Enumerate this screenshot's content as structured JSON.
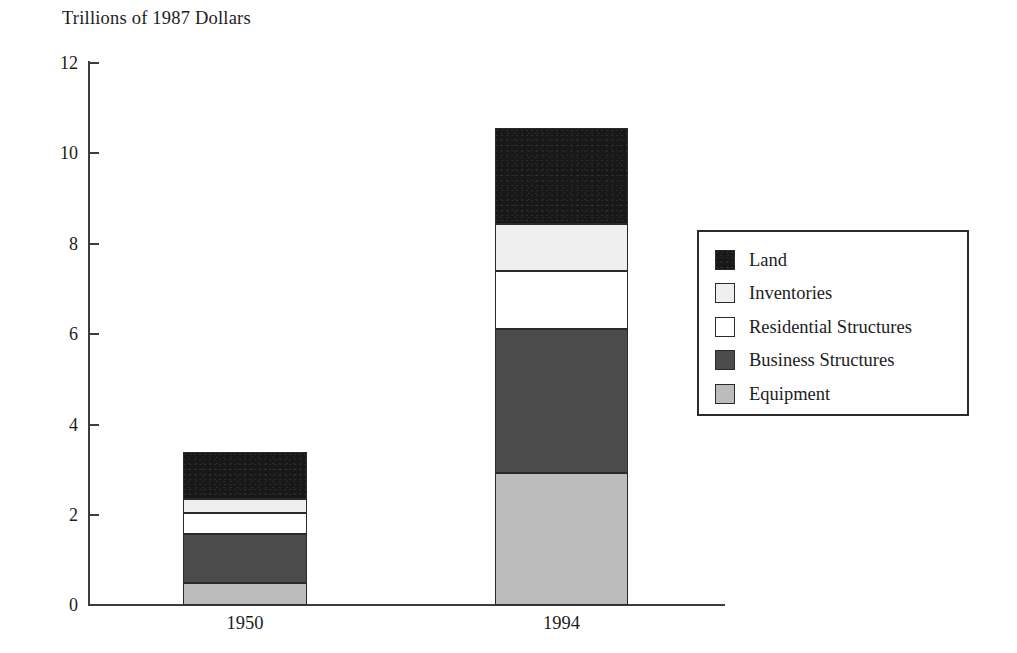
{
  "chart_data": {
    "type": "bar",
    "subtype": "stacked-vertical",
    "title": "Trillions of 1987 Dollars",
    "xlabel": "",
    "ylabel": "",
    "ylim": [
      0,
      12
    ],
    "yticks": [
      0,
      2,
      4,
      6,
      8,
      10,
      12
    ],
    "ytick_labels": [
      "0",
      "2",
      "4",
      "6",
      "8",
      "10",
      "12"
    ],
    "grid": false,
    "legend_position": "right",
    "categories": [
      "1950",
      "1994"
    ],
    "series": [
      {
        "name": "Equipment",
        "values": [
          0.49,
          2.92
        ],
        "color": "#bcbcbc"
      },
      {
        "name": "Business Structures",
        "values": [
          1.08,
          3.18
        ],
        "color": "#4b4b4b"
      },
      {
        "name": "Residential Structures",
        "values": [
          0.47,
          1.28
        ],
        "color": "#ffffff"
      },
      {
        "name": "Inventories",
        "values": [
          0.31,
          1.04
        ],
        "color": "#efefef"
      },
      {
        "name": "Land",
        "values": [
          1.03,
          2.12
        ],
        "color": "#181818"
      }
    ],
    "totals": [
      3.38,
      10.54
    ],
    "stack_order_bottom_to_top": [
      "Equipment",
      "Business Structures",
      "Residential Structures",
      "Inventories",
      "Land"
    ],
    "legend_order_top_to_bottom": [
      "Land",
      "Inventories",
      "Residential Structures",
      "Business Structures",
      "Equipment"
    ]
  },
  "legend": {
    "items": [
      {
        "label": "Land",
        "swatch": "land-swatch"
      },
      {
        "label": "Inventories",
        "swatch": "inventories-swatch"
      },
      {
        "label": "Residential Structures",
        "swatch": "residential-structures-swatch"
      },
      {
        "label": "Business Structures",
        "swatch": "business-structures-swatch"
      },
      {
        "label": "Equipment",
        "swatch": "equipment-swatch"
      }
    ]
  },
  "axes": {
    "y_tick_labels": [
      "12",
      "10",
      "8",
      "6",
      "4",
      "2",
      "0"
    ],
    "x_tick_labels": [
      "1950",
      "1994"
    ]
  }
}
